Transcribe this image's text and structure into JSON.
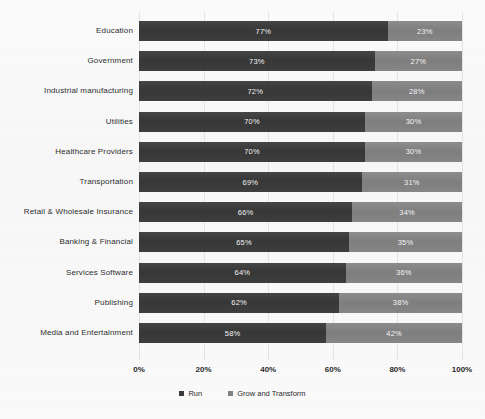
{
  "chart_data": {
    "type": "bar",
    "subtype": "horizontal-stacked-100",
    "title": "",
    "xlabel": "",
    "ylabel": "",
    "xlim": [
      0,
      100
    ],
    "xticks": [
      "0%",
      "20%",
      "40%",
      "60%",
      "80%",
      "100%"
    ],
    "xtick_values": [
      0,
      20,
      40,
      60,
      80,
      100
    ],
    "grid": true,
    "legend_position": "bottom",
    "categories": [
      "Education",
      "Government",
      "Industrial  manufacturing",
      "Utilities",
      "Healthcare Providers",
      "Transportation",
      "Retail & Wholesale Insurance",
      "Banking  &  Financial",
      "Services Software",
      "Publishing",
      "Media and Entertainment"
    ],
    "series": [
      {
        "name": "Run",
        "color": "#3b3b3b",
        "values": [
          77,
          73,
          72,
          70,
          70,
          69,
          66,
          65,
          64,
          62,
          58
        ],
        "labels": [
          "77%",
          "73%",
          "72%",
          "70%",
          "70%",
          "69%",
          "66%",
          "65%",
          "64%",
          "62%",
          "58%"
        ]
      },
      {
        "name": "Grow and Transform",
        "color": "#838383",
        "values": [
          23,
          27,
          28,
          30,
          30,
          31,
          34,
          35,
          36,
          38,
          42
        ],
        "labels": [
          "23%",
          "27%",
          "28%",
          "30%",
          "30%",
          "31%",
          "34%",
          "35%",
          "36%",
          "38%",
          "42%"
        ]
      }
    ]
  },
  "legend": {
    "items": [
      {
        "label": "Run",
        "color": "#3b3b3b"
      },
      {
        "label": "Grow and Transform",
        "color": "#838383"
      }
    ]
  }
}
